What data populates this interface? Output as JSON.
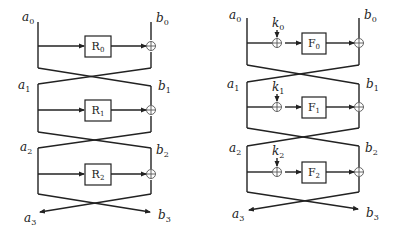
{
  "figure": {
    "left_diagram": {
      "name": "Feistel network with round functions R",
      "left_labels": [
        {
          "base": "a",
          "sub": "0"
        },
        {
          "base": "a",
          "sub": "1"
        },
        {
          "base": "a",
          "sub": "2"
        },
        {
          "base": "a",
          "sub": "3"
        }
      ],
      "right_labels": [
        {
          "base": "b",
          "sub": "0"
        },
        {
          "base": "b",
          "sub": "1"
        },
        {
          "base": "b",
          "sub": "2"
        },
        {
          "base": "b",
          "sub": "3"
        }
      ],
      "rounds": [
        {
          "fn": "R",
          "sub": "0"
        },
        {
          "fn": "R",
          "sub": "1"
        },
        {
          "fn": "R",
          "sub": "2"
        }
      ]
    },
    "right_diagram": {
      "name": "Feistel network with keyed round functions F",
      "left_labels": [
        {
          "base": "a",
          "sub": "0"
        },
        {
          "base": "a",
          "sub": "1"
        },
        {
          "base": "a",
          "sub": "2"
        },
        {
          "base": "a",
          "sub": "3"
        }
      ],
      "right_labels": [
        {
          "base": "b",
          "sub": "0"
        },
        {
          "base": "b",
          "sub": "1"
        },
        {
          "base": "b",
          "sub": "2"
        },
        {
          "base": "b",
          "sub": "3"
        }
      ],
      "keys": [
        {
          "base": "k",
          "sub": "0"
        },
        {
          "base": "k",
          "sub": "1"
        },
        {
          "base": "k",
          "sub": "2"
        }
      ],
      "rounds": [
        {
          "fn": "F",
          "sub": "0"
        },
        {
          "fn": "F",
          "sub": "1"
        },
        {
          "fn": "F",
          "sub": "2"
        }
      ]
    },
    "colors": {
      "stroke": "#222222",
      "background": "#ffffff"
    }
  }
}
